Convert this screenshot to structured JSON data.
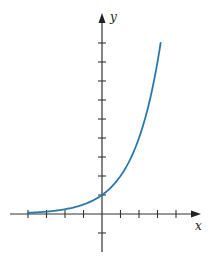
{
  "chart_data": {
    "type": "line",
    "title": "",
    "function": "y = 2^x",
    "xlabel": "x",
    "ylabel": "y",
    "xlim": [
      -5,
      5
    ],
    "ylim": [
      -1,
      10
    ],
    "x_ticks": [
      -4,
      -3,
      -2,
      -1,
      1,
      2,
      3,
      4
    ],
    "y_ticks": [
      -1,
      1,
      2,
      3,
      4,
      5,
      6,
      7,
      8,
      9
    ],
    "tick_labels_shown": false,
    "grid": false,
    "legend": null,
    "series": [
      {
        "name": "exponential curve",
        "color": "#2a79a8",
        "x": [
          -4,
          -3,
          -2,
          -1,
          0,
          1,
          2,
          3,
          3.17
        ],
        "y": [
          0.0625,
          0.125,
          0.25,
          0.5,
          1,
          2,
          4,
          8,
          9
        ]
      }
    ]
  },
  "colors": {
    "axis": "#333333",
    "curve": "#2a79a8"
  }
}
